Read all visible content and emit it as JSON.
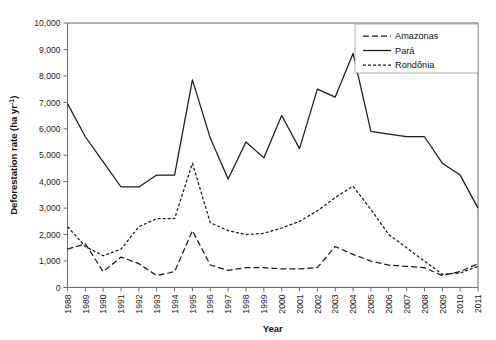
{
  "chart_data": {
    "type": "line",
    "title": "",
    "xlabel": "Year",
    "ylabel": "Deforestation rate (ha yr-1)",
    "ylabel_display": "Deforestation rate (ha yr⁻¹)",
    "grid": false,
    "legend_position": "top-right",
    "xlim": [
      1988,
      2011
    ],
    "ylim": [
      0,
      10000
    ],
    "ytick_step": 1000,
    "ytick_labels": [
      "0",
      "1,000",
      "2,000",
      "3,000",
      "4,000",
      "5,000",
      "6,000",
      "7,000",
      "8,000",
      "9,000",
      "10,000"
    ],
    "ytick_values": [
      0,
      1000,
      2000,
      3000,
      4000,
      5000,
      6000,
      7000,
      8000,
      9000,
      10000
    ],
    "categories": [
      1988,
      1989,
      1990,
      1991,
      1992,
      1993,
      1994,
      1995,
      1996,
      1997,
      1998,
      1999,
      2000,
      2001,
      2002,
      2003,
      2004,
      2005,
      2006,
      2007,
      2008,
      2009,
      2010,
      2011
    ],
    "xtick_labels": [
      "1988",
      "1989",
      "1990",
      "1991",
      "1992",
      "1993",
      "1994",
      "1995",
      "1996",
      "1997",
      "1998",
      "1999",
      "2000",
      "2001",
      "2002",
      "2003",
      "2004",
      "2005",
      "2006",
      "2007",
      "2008",
      "2009",
      "2010",
      "2011"
    ],
    "series": [
      {
        "name": "Amazonas",
        "style": "dashed",
        "dasharray": "6,3",
        "values": [
          1450,
          1650,
          600,
          1150,
          900,
          450,
          600,
          2150,
          850,
          650,
          750,
          750,
          700,
          700,
          750,
          1550,
          1250,
          1000,
          850,
          800,
          750,
          450,
          600,
          900
        ]
      },
      {
        "name": "Pará",
        "style": "solid",
        "dasharray": "",
        "values": [
          6950,
          5700,
          4750,
          3800,
          3800,
          4250,
          4250,
          7850,
          5650,
          4100,
          5500,
          4900,
          6500,
          5250,
          7500,
          7200,
          8850,
          5900,
          5800,
          5700,
          5700,
          4700,
          4250,
          3000
        ]
      },
      {
        "name": "Rondônia",
        "style": "dotted",
        "dasharray": "3,2",
        "values": [
          2300,
          1550,
          1200,
          1450,
          2300,
          2600,
          2600,
          4700,
          2450,
          2150,
          2000,
          2050,
          2250,
          2500,
          2900,
          3400,
          3830,
          2950,
          2000,
          1500,
          1000,
          500,
          550,
          800
        ]
      }
    ]
  },
  "legend": {
    "items": [
      {
        "label": "Amazonas",
        "style": "dashed"
      },
      {
        "label": "Pará",
        "style": "solid"
      },
      {
        "label": "Rondônia",
        "style": "dotted"
      }
    ]
  },
  "axes": {
    "x_title": "Year",
    "y_title_main": "Deforestation rate (ha yr",
    "y_title_sup": "-1",
    "y_title_close": ")"
  }
}
